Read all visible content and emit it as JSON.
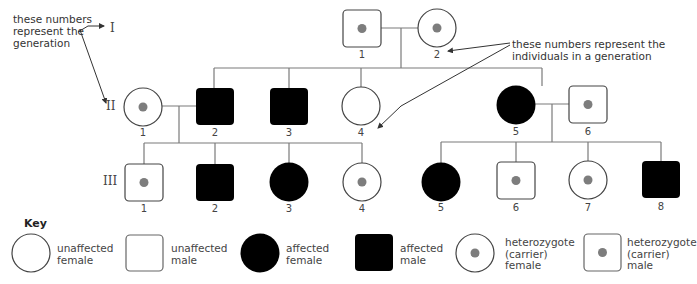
{
  "annotations": {
    "generation_note": "these numbers represent the generation",
    "generation_note_lines": [
      "these numbers",
      "represent the",
      "generation"
    ],
    "individual_note_lines": [
      "these numbers represent the",
      "individuals in a generation"
    ]
  },
  "generations": [
    {
      "label": "I",
      "individuals": [
        {
          "number": "1",
          "sex": "male",
          "status": "carrier"
        },
        {
          "number": "2",
          "sex": "female",
          "status": "carrier"
        }
      ]
    },
    {
      "label": "II",
      "individuals": [
        {
          "number": "1",
          "sex": "female",
          "status": "carrier"
        },
        {
          "number": "2",
          "sex": "male",
          "status": "affected"
        },
        {
          "number": "3",
          "sex": "male",
          "status": "affected"
        },
        {
          "number": "4",
          "sex": "female",
          "status": "unaffected"
        },
        {
          "number": "5",
          "sex": "female",
          "status": "affected"
        },
        {
          "number": "6",
          "sex": "male",
          "status": "carrier"
        }
      ]
    },
    {
      "label": "III",
      "individuals": [
        {
          "number": "1",
          "sex": "male",
          "status": "carrier"
        },
        {
          "number": "2",
          "sex": "male",
          "status": "affected"
        },
        {
          "number": "3",
          "sex": "female",
          "status": "affected"
        },
        {
          "number": "4",
          "sex": "female",
          "status": "carrier"
        },
        {
          "number": "5",
          "sex": "female",
          "status": "affected"
        },
        {
          "number": "6",
          "sex": "male",
          "status": "carrier"
        },
        {
          "number": "7",
          "sex": "female",
          "status": "carrier"
        },
        {
          "number": "8",
          "sex": "male",
          "status": "affected"
        }
      ]
    }
  ],
  "key": {
    "title": "Key",
    "items": [
      {
        "symbol": "circle-open",
        "lines": [
          "unaffected",
          "female"
        ]
      },
      {
        "symbol": "square-open",
        "lines": [
          "unaffected",
          "male"
        ]
      },
      {
        "symbol": "circle-filled",
        "lines": [
          "affected",
          "female"
        ]
      },
      {
        "symbol": "square-filled",
        "lines": [
          "affected",
          "male"
        ]
      },
      {
        "symbol": "circle-dot",
        "lines": [
          "heterozygote",
          "(carrier)",
          "female"
        ]
      },
      {
        "symbol": "square-dot",
        "lines": [
          "heterozygote",
          "(carrier)",
          "male"
        ]
      }
    ]
  },
  "colors": {
    "line": "#7a7a7a",
    "outline": "#444444",
    "affected": "#000000",
    "carrier_dot": "#7d7d7d",
    "background": "#ffffff"
  }
}
